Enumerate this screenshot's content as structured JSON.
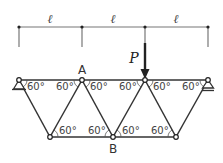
{
  "diagram": {
    "type": "truss",
    "colors": {
      "line": "#333333",
      "dim_line": "#777777",
      "text": "#333333"
    },
    "dimension": {
      "labels": [
        "ℓ",
        "ℓ",
        "ℓ"
      ],
      "ticks_x": [
        19,
        82,
        145,
        208
      ]
    },
    "load": {
      "label": "P",
      "at_node": "top_3"
    },
    "nodes": {
      "top_1": {
        "x": 19,
        "y": 80,
        "label": ""
      },
      "A": {
        "x": 82,
        "y": 80,
        "label": "A"
      },
      "top_3": {
        "x": 145,
        "y": 80,
        "label": ""
      },
      "top_4": {
        "x": 208,
        "y": 80,
        "label": ""
      },
      "bot_1": {
        "x": 50,
        "y": 137,
        "label": ""
      },
      "B": {
        "x": 113,
        "y": 137,
        "label": "B"
      },
      "bot_3": {
        "x": 176,
        "y": 137,
        "label": ""
      }
    },
    "labels": {
      "A": "A",
      "B": "B",
      "P": "P"
    },
    "angles": {
      "top": [
        "60°",
        "60°",
        "60°",
        "60°",
        "60°",
        "60°"
      ],
      "bottom": [
        "60°",
        "60°",
        "60°",
        "60°"
      ]
    },
    "supports": {
      "left": "pin",
      "right": "roller"
    }
  }
}
